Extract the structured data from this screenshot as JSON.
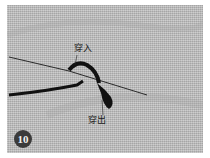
{
  "figure": {
    "step_number": "10",
    "labels": {
      "thread_in": "穿入",
      "thread_out": "穿出"
    },
    "colors": {
      "fabric": "#b9b9b9",
      "thread": "#111111",
      "badge": "#3b3b3b"
    }
  }
}
